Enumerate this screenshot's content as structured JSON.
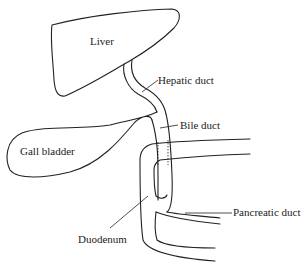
{
  "diagram": {
    "type": "anatomical line drawing",
    "labels": {
      "liver": "Liver",
      "hepatic_duct": "Hepatic duct",
      "bile_duct": "Bile duct",
      "gall_bladder": "Gall bladder",
      "pancreatic_duct": "Pancreatic duct",
      "duodenum": "Duodenum"
    }
  }
}
